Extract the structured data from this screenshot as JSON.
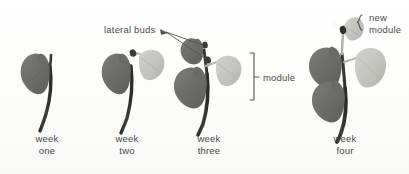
{
  "figure": {
    "background_color": "#fdfdfc",
    "dark_leaf_color": "#6f6f6d",
    "light_leaf_color": "#c2c2bd",
    "stem_color": "#3b3b39",
    "ink_color": "#4a4a48"
  },
  "annotations": {
    "lateral_buds": "lateral buds",
    "module": "module",
    "new_module_line1": "new",
    "new_module_line2": "module"
  },
  "stages": [
    {
      "id": "week-one",
      "caption_line1": "week",
      "caption_line2": "one",
      "dark_leaves": 1,
      "light_leaves": 0,
      "lateral_buds": 0
    },
    {
      "id": "week-two",
      "caption_line1": "week",
      "caption_line2": "two",
      "dark_leaves": 1,
      "light_leaves": 1,
      "lateral_buds": 1
    },
    {
      "id": "week-three",
      "caption_line1": "week",
      "caption_line2": "three",
      "dark_leaves": 2,
      "light_leaves": 1,
      "lateral_buds": 2
    },
    {
      "id": "week-four",
      "caption_line1": "week",
      "caption_line2": "four",
      "dark_leaves": 2,
      "light_leaves": 2,
      "lateral_buds": 1
    }
  ]
}
